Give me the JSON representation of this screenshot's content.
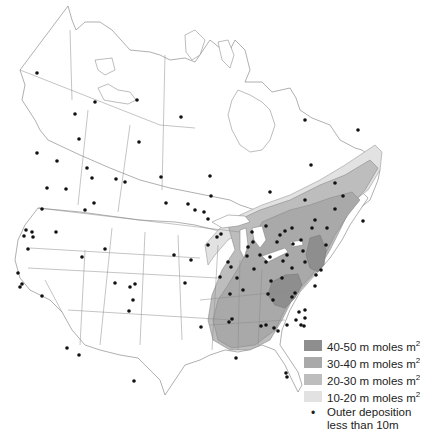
{
  "map": {
    "title": "Acid deposition across North America",
    "colors": {
      "zone_40_50": "#8e8e8e",
      "zone_30_40": "#a9a9a9",
      "zone_20_30": "#bdbdbd",
      "zone_10_20": "#e2e2e2",
      "station_dot": "#111111",
      "outline": "#7a7a7a"
    }
  },
  "legend": {
    "items": [
      {
        "label": "40-50 m moles m",
        "sup": "2",
        "color": "#8e8e8e"
      },
      {
        "label": "30-40 m moles m",
        "sup": "2",
        "color": "#a9a9a9"
      },
      {
        "label": "20-30 m moles m",
        "sup": "2",
        "color": "#bdbdbd"
      },
      {
        "label": "10-20 m moles m",
        "sup": "2",
        "color": "#e2e2e2"
      }
    ],
    "dot_label_line1": "Outer deposition",
    "dot_label_line2": "less than 10m",
    "dot_glyph": "•"
  }
}
